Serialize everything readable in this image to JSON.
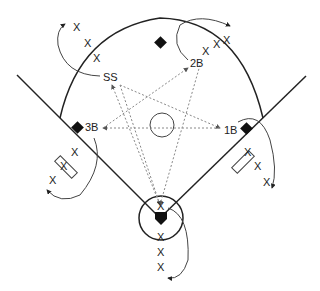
{
  "diagram": {
    "type": "baseball-field-drill",
    "colors": {
      "line": "#222222",
      "dashed": "#888888",
      "base": "#111111",
      "background": "#ffffff"
    },
    "positions": [
      {
        "id": "ss",
        "label": "SS"
      },
      {
        "id": "2b",
        "label": "2B"
      },
      {
        "id": "3b",
        "label": "3B"
      },
      {
        "id": "1b",
        "label": "1B"
      }
    ],
    "player_marker": "X",
    "lines": {
      "ss_x": [
        "X",
        "X",
        "X"
      ],
      "2b_x": [
        "X",
        "X",
        "X"
      ],
      "3b_x": [
        "X",
        "X",
        "X"
      ],
      "1b_x": [
        "X",
        "X",
        "X"
      ],
      "home_x": [
        "X",
        "X",
        "X",
        "X"
      ]
    }
  }
}
